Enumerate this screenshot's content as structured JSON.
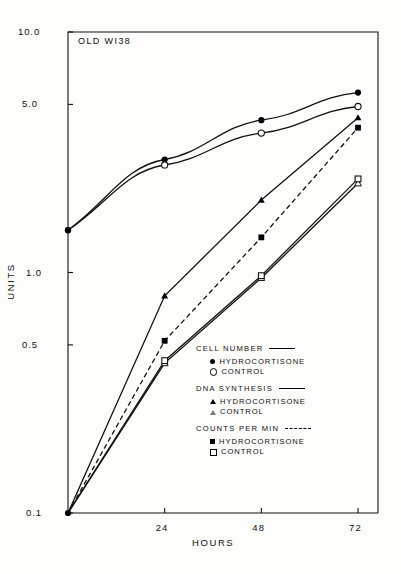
{
  "figure": {
    "panel_label": "OLD WI38",
    "xlabel": "HOURS",
    "ylabel": "UNITS"
  },
  "axes": {
    "y_ticks": [
      "10.0",
      "5.0",
      "1.0",
      "0.5",
      "0.1"
    ],
    "x_ticks": [
      "24",
      "48",
      "72"
    ]
  },
  "legend": {
    "groups": [
      {
        "title": "CELL NUMBER",
        "line": "solid",
        "entries": [
          {
            "label": "HYDROCORTISONE",
            "marker": "filled-circle"
          },
          {
            "label": "CONTROL",
            "marker": "open-circle"
          }
        ]
      },
      {
        "title": "DNA SYNTHESIS",
        "line": "solid",
        "entries": [
          {
            "label": "HYDROCORTISONE",
            "marker": "filled-triangle"
          },
          {
            "label": "CONTROL",
            "marker": "open-triangle"
          }
        ]
      },
      {
        "title": "COUNTS PER MIN",
        "line": "dashed",
        "entries": [
          {
            "label": "HYDROCORTISONE",
            "marker": "filled-square"
          },
          {
            "label": "CONTROL",
            "marker": "open-square"
          }
        ]
      }
    ]
  },
  "chart_data": {
    "type": "line",
    "title": "OLD WI38",
    "xlabel": "HOURS",
    "ylabel": "UNITS",
    "yscale": "log",
    "ylim": [
      0.1,
      10.0
    ],
    "xlim": [
      0,
      72
    ],
    "y_tick_values": [
      10.0,
      5.0,
      1.0,
      0.5,
      0.1
    ],
    "x_tick_values": [
      24,
      48,
      72
    ],
    "grid": false,
    "legend_position": "inside-lower-right",
    "x": [
      0,
      24,
      48,
      72
    ],
    "series": [
      {
        "name": "CELL NUMBER HYDROCORTISONE",
        "marker": "filled-circle",
        "line": "solid",
        "values": [
          1.5,
          2.95,
          4.3,
          5.6
        ]
      },
      {
        "name": "CELL NUMBER CONTROL",
        "marker": "open-circle",
        "line": "solid",
        "values": [
          1.5,
          2.8,
          3.8,
          4.9
        ]
      },
      {
        "name": "DNA SYNTHESIS HYDROCORTISONE",
        "marker": "filled-triangle",
        "line": "solid",
        "values": [
          0.1,
          0.8,
          2.0,
          4.4
        ]
      },
      {
        "name": "DNA SYNTHESIS CONTROL",
        "marker": "open-triangle",
        "line": "solid",
        "values": [
          0.1,
          0.42,
          0.95,
          2.35
        ]
      },
      {
        "name": "COUNTS PER MIN HYDROCORTISONE",
        "marker": "filled-square",
        "line": "dashed",
        "values": [
          0.1,
          0.52,
          1.4,
          4.0
        ]
      },
      {
        "name": "COUNTS PER MIN CONTROL",
        "marker": "open-square",
        "line": "solid",
        "values": [
          0.1,
          0.43,
          0.97,
          2.45
        ]
      }
    ]
  }
}
